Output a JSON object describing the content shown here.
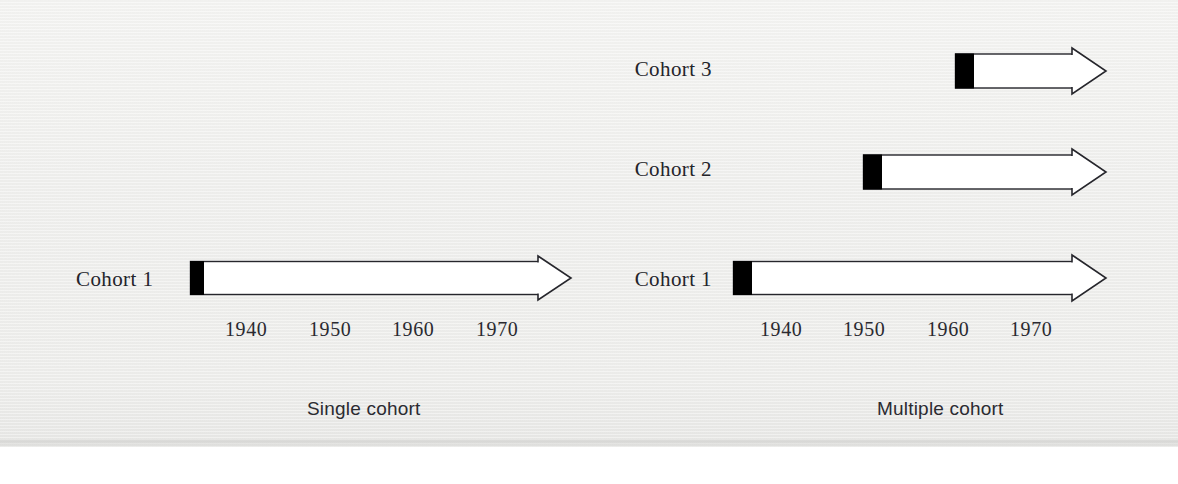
{
  "figure": {
    "background_color": "#f1f1ef",
    "ink_color": "#26262c",
    "fill_color": "#ffffff",
    "marker_color": "#000000"
  },
  "panels": [
    {
      "id": "single-cohort",
      "caption": "Single cohort",
      "caption_x": 307,
      "caption_y": 398,
      "rows": [
        {
          "label": "Cohort 1",
          "label_x": 76,
          "label_y": 267,
          "label_width": 100,
          "bar_x": 190,
          "bar_y": 261,
          "bar_height": 33,
          "marker_width": 13,
          "body_end_x": 538,
          "tip_x": 571,
          "head_half_height": 22
        }
      ],
      "axis": {
        "y": 318,
        "ticks": [
          {
            "label": "1940",
            "x": 225
          },
          {
            "label": "1950",
            "x": 309
          },
          {
            "label": "1960",
            "x": 392
          },
          {
            "label": "1970",
            "x": 476
          }
        ]
      }
    },
    {
      "id": "multiple-cohort",
      "caption": "Multiple cohort",
      "caption_x": 877,
      "caption_y": 398,
      "rows": [
        {
          "label": "Cohort 3",
          "label_x": 612,
          "label_y": 57,
          "label_width": 100,
          "bar_x": 955,
          "bar_y": 54,
          "bar_height": 34,
          "marker_width": 18,
          "body_end_x": 1072,
          "tip_x": 1106,
          "head_half_height": 23
        },
        {
          "label": "Cohort 2",
          "label_x": 612,
          "label_y": 157,
          "label_width": 100,
          "bar_x": 863,
          "bar_y": 155,
          "bar_height": 34,
          "marker_width": 18,
          "body_end_x": 1072,
          "tip_x": 1106,
          "head_half_height": 23
        },
        {
          "label": "Cohort 1",
          "label_x": 612,
          "label_y": 267,
          "label_width": 100,
          "bar_x": 733,
          "bar_y": 261,
          "bar_height": 33,
          "marker_width": 18,
          "body_end_x": 1072,
          "tip_x": 1106,
          "head_half_height": 23
        }
      ],
      "axis": {
        "y": 318,
        "ticks": [
          {
            "label": "1940",
            "x": 760
          },
          {
            "label": "1950",
            "x": 843
          },
          {
            "label": "1960",
            "x": 927
          },
          {
            "label": "1970",
            "x": 1010
          }
        ]
      }
    }
  ],
  "chart_data": {
    "type": "diagram",
    "title": "",
    "subtitle": "",
    "xlabel": "Year",
    "ylabel": "",
    "grid": false,
    "legend": "none",
    "axis_ticks": [
      1940,
      1950,
      1960,
      1970
    ],
    "panels": [
      {
        "name": "Single cohort",
        "cohorts": [
          {
            "name": "Cohort 1",
            "start_year": 1936,
            "end_year": 1977,
            "open_ended": true
          }
        ]
      },
      {
        "name": "Multiple cohort",
        "cohorts": [
          {
            "name": "Cohort 1",
            "start_year": 1936,
            "end_year": 1977,
            "open_ended": true
          },
          {
            "name": "Cohort 2",
            "start_year": 1951,
            "end_year": 1977,
            "open_ended": true
          },
          {
            "name": "Cohort 3",
            "start_year": 1962,
            "end_year": 1977,
            "open_ended": true
          }
        ]
      }
    ]
  }
}
